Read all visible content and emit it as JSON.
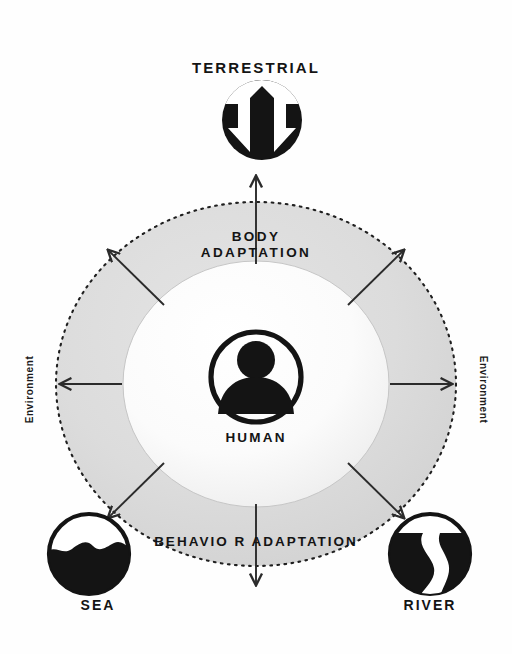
{
  "diagram": {
    "center": {
      "label": "HUMAN",
      "icon": "person-in-circle-icon"
    },
    "inner_ring_label": {
      "label": "BODY\nADAPTATION",
      "line1": "BODY",
      "line2": "ADAPTATION"
    },
    "outer_ring_label": {
      "label": "BEHAVIO R ADAPTATION"
    },
    "environment_labels": {
      "left": "Environment",
      "right": "Environment"
    },
    "nodes": [
      {
        "id": "terrestrial",
        "label": "TERRESTRIAL",
        "icon": "mountain-arrows-icon",
        "position": "top"
      },
      {
        "id": "sea",
        "label": "SEA",
        "icon": "wave-circle-icon",
        "position": "bottom-left"
      },
      {
        "id": "river",
        "label": "RIVER",
        "icon": "river-circle-icon",
        "position": "bottom-right"
      }
    ],
    "arrows": {
      "count": 8,
      "directions": [
        "up",
        "up-right",
        "right",
        "down-right",
        "down",
        "down-left",
        "left",
        "up-left"
      ],
      "style": "outward"
    },
    "colors": {
      "ink": "#141414",
      "background": "#fefefe",
      "outer_ring_fill": "#d6d6d6",
      "inner_circle_fill": "#fafafa",
      "dashed_border": "#1f1f1f",
      "arrow": "#2b2b2b"
    }
  }
}
